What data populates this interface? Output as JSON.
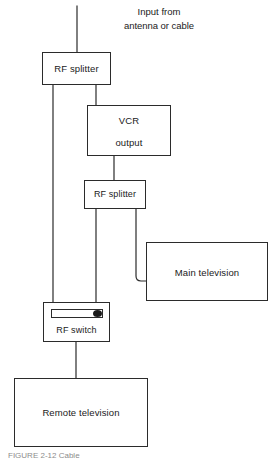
{
  "figure": {
    "type": "block-diagram",
    "caption": "FIGURE 2-12 Cable",
    "caption_note": "clipped at bottom edge of image",
    "line_color": "#2b2b2b",
    "background_color": "#ffffff",
    "text_color": "#1a1a1a"
  },
  "annotations": {
    "input_source": {
      "line1": "Input from",
      "line2": "antenna or cable"
    }
  },
  "nodes": {
    "rf_splitter_1": {
      "label": "RF splitter"
    },
    "vcr": {
      "title": "VCR",
      "output_label": "output"
    },
    "rf_splitter_2": {
      "label": "RF splitter"
    },
    "main_television": {
      "label": "Main television"
    },
    "rf_switch": {
      "label": "RF switch",
      "knob_position": "right"
    },
    "remote_television": {
      "label": "Remote television"
    }
  },
  "connections": [
    {
      "from": "antenna-input",
      "to": "rf_splitter_1"
    },
    {
      "from": "rf_splitter_1",
      "to": "vcr"
    },
    {
      "from": "rf_splitter_1",
      "to": "rf_switch"
    },
    {
      "from": "vcr",
      "to": "rf_splitter_2"
    },
    {
      "from": "rf_splitter_2",
      "to": "rf_switch"
    },
    {
      "from": "rf_splitter_2",
      "to": "main_television"
    },
    {
      "from": "rf_switch",
      "to": "remote_television"
    }
  ]
}
